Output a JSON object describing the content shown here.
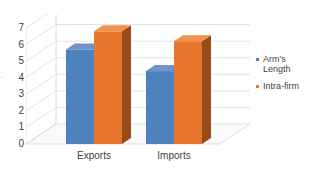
{
  "chart_data": {
    "type": "bar",
    "title": "",
    "subtitle": "",
    "xlabel": "",
    "ylabel": "",
    "categories": [
      "Exports",
      "Imports"
    ],
    "series": [
      {
        "name": "Arm's Length",
        "values": [
          5.7,
          4.4
        ],
        "color": "#4F81BD"
      },
      {
        "name": "Intra-firm",
        "values": [
          6.8,
          6.2
        ],
        "color": "#E8762C"
      }
    ],
    "ylim": [
      0,
      7
    ],
    "ytick_labels": [
      "7",
      "6",
      "5",
      "4",
      "3",
      "2",
      "1",
      "0"
    ],
    "ytick_values": [
      7,
      6,
      5,
      4,
      3,
      2,
      1,
      0
    ],
    "grid": true,
    "grid_axis": "y",
    "legend_position": "right",
    "three_d": true
  },
  "axis": {
    "clipped_title_fragment": "-"
  },
  "legend": {
    "items": [
      {
        "label": "Arm's\nLength",
        "color": "#4F81BD"
      },
      {
        "label": "Intra-firm",
        "color": "#E8762C"
      }
    ]
  },
  "colors": {
    "series_blue_front": "#4F81BD",
    "series_blue_side": "#385D8A",
    "series_blue_top": "#6E93C8",
    "series_orange_front": "#E8762C",
    "series_orange_side": "#974D1A",
    "series_orange_top": "#F2914B",
    "gridline": "#D6D6D6",
    "floor": "#FAFAFA",
    "floor_edge": "#CFCFCF",
    "text": "#3F3F3F"
  }
}
